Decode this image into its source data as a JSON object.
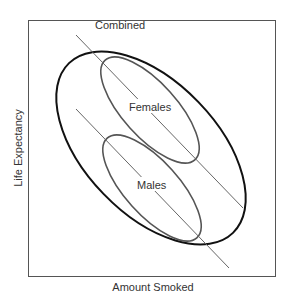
{
  "diagram": {
    "type": "scatter-ellipse-schematic",
    "x_axis_label": "Amount Smoked",
    "y_axis_label": "Life Expectancy",
    "groups": [
      {
        "label": "Combined",
        "description": "Large ellipse enclosing both groups"
      },
      {
        "label": "Females",
        "description": "Upper ellipse with downward-sloping regression line"
      },
      {
        "label": "Males",
        "description": "Lower ellipse with downward-sloping regression line"
      }
    ],
    "colors": {
      "frame": "#555555",
      "combined": "#111111",
      "group_ellipse": "#555555",
      "regression_line": "#666666",
      "text": "#333333"
    }
  }
}
